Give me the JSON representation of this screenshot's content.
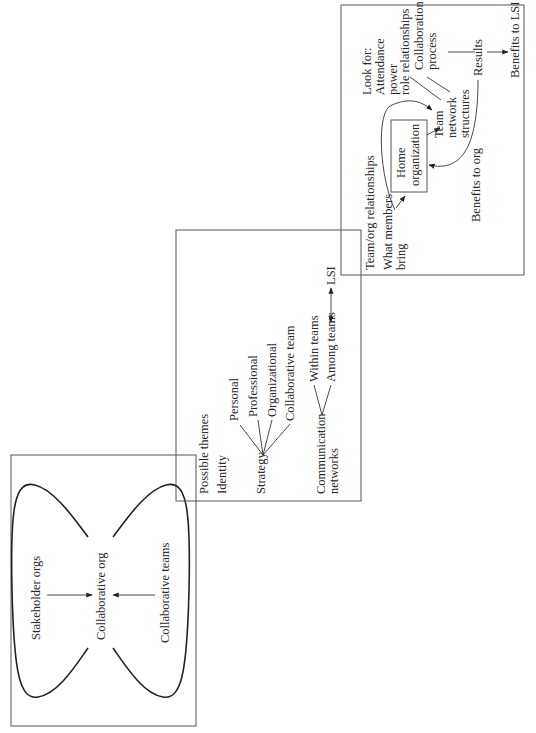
{
  "panel_left": {
    "labels": {
      "stakeholder": "Stakeholder orgs",
      "collab_org": "Collaborative org",
      "collab_teams": "Collaborative teams"
    }
  },
  "panel_middle": {
    "title": "Possible themes",
    "identity": "Identity",
    "strategy": "Strategy",
    "strategy_branches": [
      "Personal",
      "Professional",
      "Organizational",
      "Collaborative team"
    ],
    "communication": [
      "Communication",
      "networks"
    ],
    "comm_branches": [
      "Within teams",
      "Among teams"
    ],
    "lsi": "LSI"
  },
  "panel_right": {
    "team_org": "Team/org relationships",
    "what_members": [
      "What members",
      "bring"
    ],
    "home_org": [
      "Home",
      "organization"
    ],
    "benefits_org": "Benefits to org",
    "team_network": [
      "Team",
      "network",
      "structures"
    ],
    "look_for": [
      "Look for:",
      "Attendance",
      "power",
      "role relationships"
    ],
    "collab_process": [
      "Collaboration",
      "process"
    ],
    "results": "Results",
    "benefits_lsi": "Benefits to LSI"
  }
}
